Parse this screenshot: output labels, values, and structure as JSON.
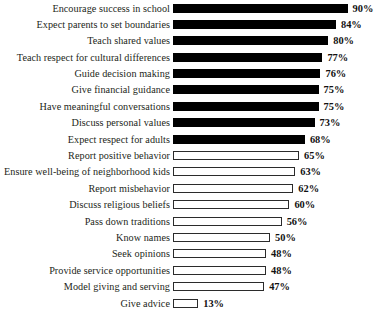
{
  "chart_data": {
    "type": "bar",
    "orientation": "horizontal",
    "title": "",
    "subtitle": "",
    "xlabel": "",
    "ylabel": "",
    "xlim": [
      0,
      100
    ],
    "grid": false,
    "legend": null,
    "value_suffix": "%",
    "categories": [
      "Encourage success in school",
      "Expect parents to set boundaries",
      "Teach shared values",
      "Teach respect for cultural differences",
      "Guide decision making",
      "Give financial guidance",
      "Have meaningful conversations",
      "Discuss personal values",
      "Expect respect for adults",
      "Report positive behavior",
      "Ensure well-being of neighborhood kids",
      "Report misbehavior",
      "Discuss religious beliefs",
      "Pass down traditions",
      "Know names",
      "Seek opinions",
      "Provide service opportunities",
      "Model giving and serving",
      "Give advice"
    ],
    "values": [
      90,
      84,
      80,
      77,
      76,
      75,
      75,
      73,
      68,
      65,
      63,
      62,
      60,
      56,
      50,
      48,
      48,
      47,
      13
    ],
    "value_labels": [
      "90%",
      "84%",
      "80%",
      "77%",
      "76%",
      "75%",
      "75%",
      "73%",
      "68%",
      "65%",
      "63%",
      "62%",
      "60%",
      "56%",
      "50%",
      "48%",
      "48%",
      "47%",
      "13%"
    ],
    "bar_styles": [
      "filled",
      "filled",
      "filled",
      "filled",
      "filled",
      "filled",
      "filled",
      "filled",
      "filled",
      "hollow",
      "hollow",
      "hollow",
      "hollow",
      "hollow",
      "hollow",
      "hollow",
      "hollow",
      "hollow",
      "hollow"
    ],
    "colors": {
      "filled": "#000000",
      "hollow_fill": "#ffffff",
      "hollow_stroke": "#2b2b2b",
      "background": "#ffffff",
      "label_text": "#231f20",
      "value_text": "#111111"
    }
  }
}
